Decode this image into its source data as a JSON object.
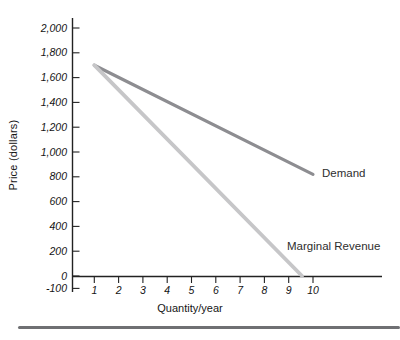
{
  "figure": {
    "background": "#ffffff",
    "bottom_rule_color": "#6f7073",
    "axis_color": "#222222",
    "tick_text_color": "#141414"
  },
  "chart_data": {
    "type": "line",
    "title": "",
    "xlabel": "Quantity/year",
    "ylabel": "Price (dollars)",
    "grid": false,
    "xlim": [
      0,
      12.8
    ],
    "ylim": [
      -100,
      2080
    ],
    "x_ticks": [
      {
        "label": "1",
        "value": 1
      },
      {
        "label": "2",
        "value": 2
      },
      {
        "label": "3",
        "value": 3
      },
      {
        "label": "4",
        "value": 4
      },
      {
        "label": "5",
        "value": 5
      },
      {
        "label": "6",
        "value": 6
      },
      {
        "label": "7",
        "value": 7
      },
      {
        "label": "8",
        "value": 8
      },
      {
        "label": "9",
        "value": 9
      },
      {
        "label": "10",
        "value": 10
      }
    ],
    "y_ticks": [
      {
        "label": "2,000",
        "value": 2000
      },
      {
        "label": "1,800",
        "value": 1800
      },
      {
        "label": "1,600",
        "value": 1600
      },
      {
        "label": "1,400",
        "value": 1400
      },
      {
        "label": "1,200",
        "value": 1200
      },
      {
        "label": "1,000",
        "value": 1000
      },
      {
        "label": "800",
        "value": 800
      },
      {
        "label": "600",
        "value": 600
      },
      {
        "label": "400",
        "value": 400
      },
      {
        "label": "200",
        "value": 200
      },
      {
        "label": "0",
        "value": 0
      },
      {
        "label": "-100",
        "value": -100
      }
    ],
    "series": [
      {
        "name": "Demand",
        "color": "#8d8d91",
        "stroke_width": 3.2,
        "points": [
          [
            1,
            1700
          ],
          [
            10,
            820
          ]
        ]
      },
      {
        "name": "Marginal Revenue",
        "color": "#c6c6c8",
        "stroke_width": 3.8,
        "points": [
          [
            1,
            1700
          ],
          [
            9.55,
            0
          ]
        ]
      }
    ],
    "legend_position": "inline-labels"
  }
}
